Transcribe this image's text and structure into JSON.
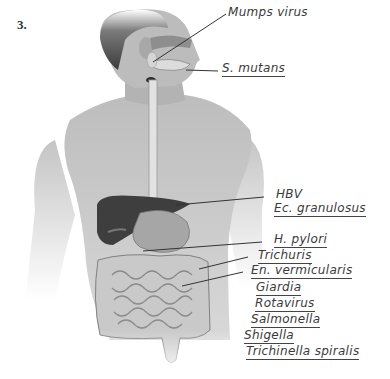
{
  "question_number": "3.",
  "figure": {
    "style": "grayscale-illustration"
  },
  "labels": [
    {
      "id": "mumps",
      "text": "Mumps virus",
      "target": "salivary-gland",
      "underlined": false
    },
    {
      "id": "smutans",
      "text": "S. mutans",
      "target": "mouth-teeth",
      "underlined": true
    },
    {
      "id": "hbv",
      "text": "HBV",
      "target": "liver",
      "underlined": false
    },
    {
      "id": "ecgran",
      "text": "Ec. granulosus",
      "target": "liver",
      "underlined": true
    },
    {
      "id": "hpylori",
      "text": "H. pylori",
      "target": "stomach",
      "underlined": true
    },
    {
      "id": "trichuris",
      "text": "Trichuris",
      "target": "large-intestine",
      "underlined": true
    },
    {
      "id": "envermic",
      "text": "En. vermicularis",
      "target": "small-intestine",
      "underlined": true
    },
    {
      "id": "giardia",
      "text": "Giardia",
      "target": "small-intestine",
      "underlined": true
    },
    {
      "id": "rotavirus",
      "text": "Rotavirus",
      "target": "small-intestine",
      "underlined": true
    },
    {
      "id": "salmonella",
      "text": "Salmonella",
      "target": "intestines",
      "underlined": true
    },
    {
      "id": "shigella",
      "text": "Shigella",
      "target": "intestines",
      "underlined": true
    },
    {
      "id": "trichinella",
      "text": "Trichinella spiralis",
      "target": "intestines",
      "underlined": true
    }
  ]
}
